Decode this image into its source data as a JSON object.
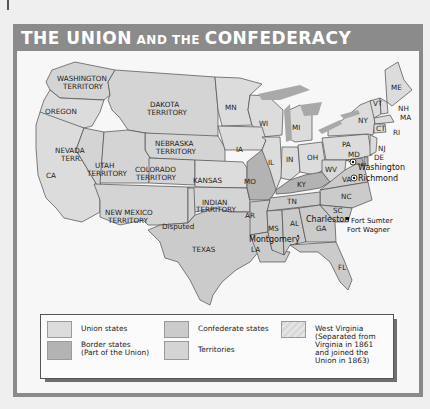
{
  "title": {
    "part1": "THE UNION",
    "part2": " AND THE ",
    "part3": "CONFEDERACY"
  },
  "colors": {
    "union": "#dcdcdc",
    "confederate": "#cbcbcb",
    "border": "#b3b3b3",
    "territory": "#d4d4d4",
    "west_virginia": "#d8d8d8",
    "water": "#a9a9a9",
    "header": "#8b8b8b"
  },
  "map": {
    "labels": {
      "washington_territory_1": "WASHINGTON",
      "washington_territory_2": "TERRITORY",
      "oregon": "OREGON",
      "dakota_1": "DAKOTA",
      "dakota_2": "TERRITORY",
      "nebraska_1": "NEBRASKA",
      "nebraska_2": "TERRITORY",
      "nevada_1": "NEVADA",
      "nevada_2": "TERR.",
      "utah_1": "UTAH",
      "utah_2": "TERRITORY",
      "colorado_1": "COLORADO",
      "colorado_2": "TERRITORY",
      "ca": "CA",
      "kansas": "KANSAS",
      "new_mexico_1": "NEW MEXICO",
      "new_mexico_2": "TERRITORY",
      "indian_1": "INDIAN",
      "indian_2": "TERRITORY",
      "disputed": "Disputed",
      "texas": "TEXAS",
      "mn": "MN",
      "wi": "WI",
      "mi": "MI",
      "ia": "IA",
      "il": "IL",
      "in": "IN",
      "oh": "OH",
      "mo": "MO",
      "ky": "KY",
      "wv": "WV",
      "va": "VA",
      "pa": "PA",
      "ny": "NY",
      "me": "ME",
      "vt": "VT",
      "nh": "NH",
      "ma": "MA",
      "ct": "CT",
      "ri": "RI",
      "nj": "NJ",
      "de": "DE",
      "md": "MD",
      "nc": "NC",
      "tn": "TN",
      "ar": "AR",
      "sc": "SC",
      "ga": "GA",
      "al": "AL",
      "ms": "MS",
      "la": "LA",
      "fl": "FL",
      "washington": "Washington",
      "richmond": "Richmond",
      "charleston": "Charleston",
      "fort_sumter": "Fort Sumter",
      "fort_wagner": "Fort Wagner",
      "montgomery": "Montgomery"
    }
  },
  "legend": {
    "items": [
      {
        "label": "Union states"
      },
      {
        "label": "Border states\n(Part of the Union)"
      },
      {
        "label": "Confederate states"
      },
      {
        "label": "Territories"
      },
      {
        "label": "West Virginia\n(Separated from\nVirginia in 1861\nand joined the\nUnion in 1863)"
      }
    ]
  }
}
